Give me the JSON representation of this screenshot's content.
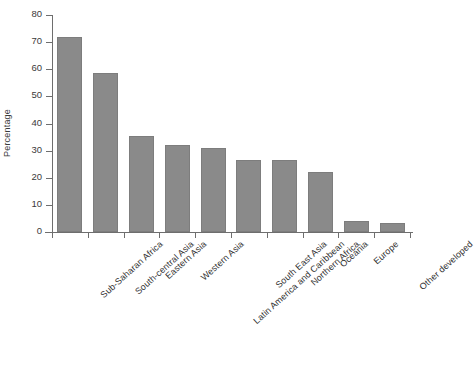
{
  "chart_data": {
    "type": "bar",
    "title": "",
    "xlabel": "",
    "ylabel": "Percentage",
    "ylim": [
      0,
      80
    ],
    "yticks": [
      0,
      10,
      20,
      30,
      40,
      50,
      60,
      70,
      80
    ],
    "grid": false,
    "legend": "none",
    "bar_color": "#8a8a8a",
    "axis_color": "#6e6e6e",
    "categories": [
      "Sub-Saharan Africa",
      "South-central Asia",
      "Eastern Asia",
      "Western Asia",
      "Latin America and Caribbean",
      "South East Asia",
      "Northern Africa",
      "Oceania",
      "Europe",
      "Other developed"
    ],
    "values": [
      72,
      58.5,
      35.5,
      32,
      31,
      26.5,
      26.5,
      22,
      4,
      3.5
    ]
  }
}
